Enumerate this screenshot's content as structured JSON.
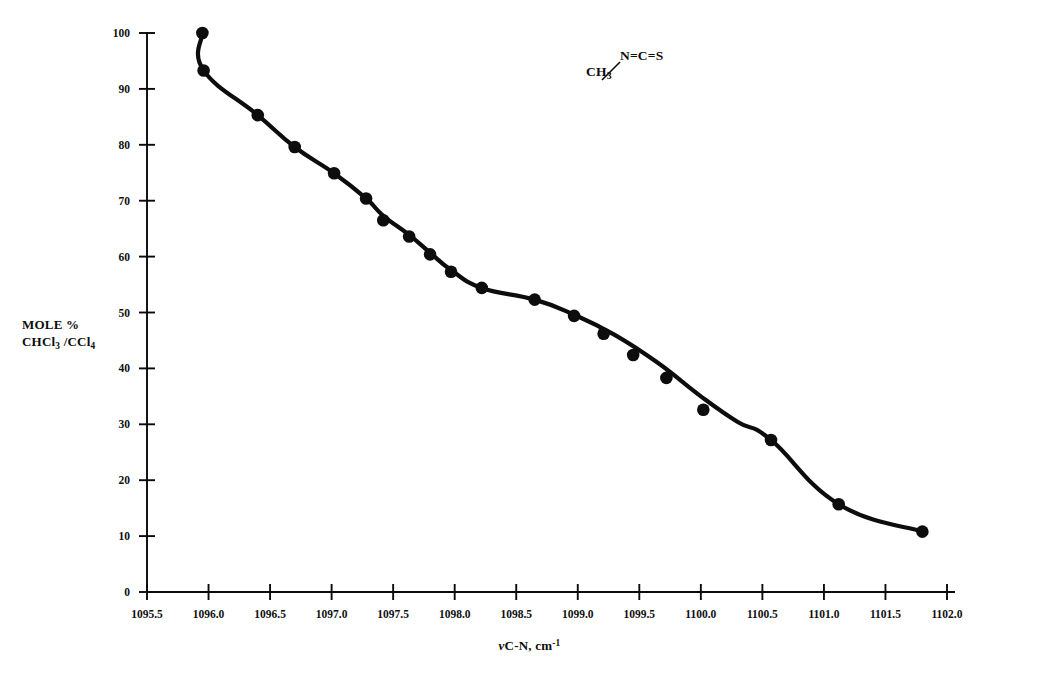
{
  "chart_data": {
    "type": "scatter",
    "title": "",
    "xlabel": "νC-N, cm-1",
    "xlabel_parts": {
      "nu": "ν",
      "main": "C-N, cm",
      "sup": "-1"
    },
    "ylabel": "MOLE % CHCl3 /CCl4",
    "ylabel_line1": "MOLE %",
    "ylabel_line2_parts": {
      "a": "CHCl",
      "a_sub": "3",
      "b": " /CCl",
      "b_sub": "4"
    },
    "xlim": [
      1095.5,
      1102.0
    ],
    "ylim": [
      0,
      100
    ],
    "xticks": [
      1095.5,
      1096.0,
      1096.5,
      1097.0,
      1097.5,
      1098.0,
      1098.5,
      1099.0,
      1099.5,
      1100.0,
      1100.5,
      1101.0,
      1101.5,
      1102.0
    ],
    "xticklabels": [
      "1095.5",
      "1096.0",
      "1096.5",
      "1097.0",
      "1097.5",
      "1098.0",
      "1098.5",
      "1099.0",
      "1099.5",
      "1100.0",
      "1100.5",
      "1101.0",
      "1101.5",
      "1102.0"
    ],
    "yticks": [
      0,
      10,
      20,
      30,
      40,
      50,
      60,
      70,
      80,
      90,
      100
    ],
    "yticklabels": [
      "0",
      "10",
      "20",
      "30",
      "40",
      "50",
      "60",
      "70",
      "80",
      "90",
      "100"
    ],
    "grid": false,
    "legend": null,
    "marker": "filled-circle",
    "marker_color": "#0d0d0d",
    "line_color": "#0d0d0d",
    "x": [
      1095.95,
      1095.96,
      1096.4,
      1096.7,
      1097.02,
      1097.28,
      1097.42,
      1097.63,
      1097.8,
      1097.97,
      1098.22,
      1098.65,
      1098.97,
      1099.21,
      1099.45,
      1099.72,
      1100.02,
      1100.57,
      1101.12,
      1101.8
    ],
    "y": [
      100.0,
      93.3,
      85.3,
      79.6,
      74.9,
      70.4,
      66.5,
      63.6,
      60.4,
      57.3,
      54.4,
      52.3,
      49.4,
      46.2,
      42.4,
      38.3,
      32.6,
      27.2,
      15.7,
      10.8
    ],
    "points": [
      {
        "x": 1095.95,
        "y": 100.0
      },
      {
        "x": 1095.96,
        "y": 93.3
      },
      {
        "x": 1096.4,
        "y": 85.3
      },
      {
        "x": 1096.7,
        "y": 79.6
      },
      {
        "x": 1097.02,
        "y": 74.9
      },
      {
        "x": 1097.28,
        "y": 70.4
      },
      {
        "x": 1097.42,
        "y": 66.5
      },
      {
        "x": 1097.63,
        "y": 63.6
      },
      {
        "x": 1097.8,
        "y": 60.4
      },
      {
        "x": 1097.97,
        "y": 57.3
      },
      {
        "x": 1098.22,
        "y": 54.4
      },
      {
        "x": 1098.65,
        "y": 52.3
      },
      {
        "x": 1098.97,
        "y": 49.4
      },
      {
        "x": 1099.21,
        "y": 46.2
      },
      {
        "x": 1099.45,
        "y": 42.4
      },
      {
        "x": 1099.72,
        "y": 38.3
      },
      {
        "x": 1100.02,
        "y": 32.6
      },
      {
        "x": 1100.57,
        "y": 27.2
      },
      {
        "x": 1101.12,
        "y": 15.7
      },
      {
        "x": 1101.8,
        "y": 10.8
      }
    ],
    "curve": [
      {
        "x": 1095.95,
        "y": 100.0
      },
      {
        "x": 1095.96,
        "y": 93.3
      },
      {
        "x": 1096.4,
        "y": 85.3
      },
      {
        "x": 1096.7,
        "y": 79.6
      },
      {
        "x": 1097.02,
        "y": 74.9
      },
      {
        "x": 1097.28,
        "y": 70.4
      },
      {
        "x": 1097.42,
        "y": 67.3
      },
      {
        "x": 1097.63,
        "y": 63.9
      },
      {
        "x": 1097.8,
        "y": 60.7
      },
      {
        "x": 1097.97,
        "y": 57.6
      },
      {
        "x": 1098.22,
        "y": 54.4
      },
      {
        "x": 1098.65,
        "y": 52.3
      },
      {
        "x": 1098.97,
        "y": 49.6
      },
      {
        "x": 1099.3,
        "y": 46.0
      },
      {
        "x": 1099.65,
        "y": 41.0
      },
      {
        "x": 1100.0,
        "y": 35.0
      },
      {
        "x": 1100.3,
        "y": 30.4
      },
      {
        "x": 1100.57,
        "y": 27.2
      },
      {
        "x": 1101.12,
        "y": 15.7
      },
      {
        "x": 1101.8,
        "y": 10.8
      }
    ],
    "annotations": [
      {
        "name": "methyl-isothiocyanate-structure",
        "line1": "N=C=S",
        "line2": "CH3",
        "line2_parts": {
          "main": "CH",
          "sub": "3"
        },
        "x": 1099.1,
        "y": 92
      }
    ]
  }
}
